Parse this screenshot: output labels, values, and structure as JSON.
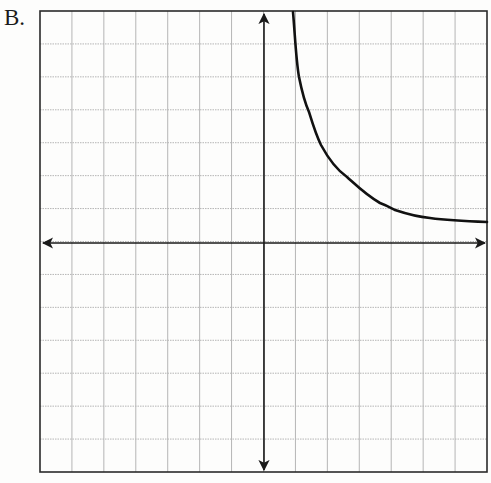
{
  "figure": {
    "label": "B.",
    "colors": {
      "background": "#fdfdfc",
      "grid": "#b5b5b5",
      "border": "#2a2a2a",
      "axes": "#1a1a1a",
      "curve": "#111111"
    }
  },
  "graph": {
    "type": "coordinate-grid",
    "x_range": [
      -7,
      7
    ],
    "y_range": [
      -7,
      7
    ],
    "grid_step": 1,
    "axes_arrows": true,
    "tick_labels": false,
    "curve": {
      "description": "decreasing hyperbola branch in quadrant I, vertical asymptote near x=1, approaching y≈0.5 as x increases",
      "sample_points": [
        [
          0.9,
          7.0
        ],
        [
          1.0,
          6.1
        ],
        [
          1.1,
          5.1
        ],
        [
          1.25,
          4.4
        ],
        [
          1.4,
          4.0
        ],
        [
          1.75,
          3.0
        ],
        [
          2.1,
          2.4
        ],
        [
          2.55,
          2.0
        ],
        [
          2.95,
          1.6
        ],
        [
          3.6,
          1.2
        ],
        [
          4.1,
          1.0
        ],
        [
          5.1,
          0.77
        ],
        [
          6.0,
          0.68
        ],
        [
          6.9,
          0.65
        ]
      ]
    }
  }
}
